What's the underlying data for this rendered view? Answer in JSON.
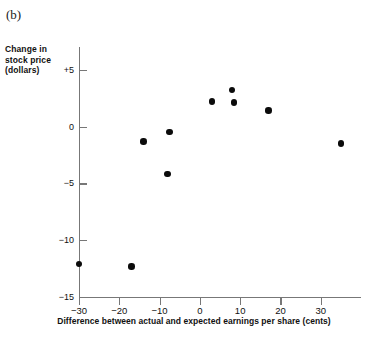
{
  "figure": {
    "panel_label": "(b)"
  },
  "chart_data": {
    "type": "scatter",
    "title": "",
    "xlabel": "Difference between actual and expected earnings per share (cents)",
    "ylabel": "Change in stock price (dollars)",
    "ylabel_lines": [
      "Change in",
      "stock price",
      "(dollars)"
    ],
    "xlim": [
      -30,
      40
    ],
    "ylim": [
      -15,
      7
    ],
    "grid": false,
    "legend": null,
    "xticks": [
      -30,
      -20,
      -10,
      0,
      10,
      20,
      30
    ],
    "xtick_labels": [
      "−30",
      "−20",
      "−10",
      "0",
      "10",
      "20",
      "30"
    ],
    "yticks": [
      5,
      0,
      -5,
      -10,
      -15
    ],
    "ytick_labels": [
      "+5",
      "0",
      "−5",
      "−10",
      "−15"
    ],
    "marker": {
      "shape": "circle",
      "color": "#0b0b0b",
      "size_px": 6.4
    },
    "points": [
      {
        "x": -30.0,
        "y": -12.1
      },
      {
        "x": -17.0,
        "y": -12.3
      },
      {
        "x": -14.0,
        "y": -1.3
      },
      {
        "x": -8.0,
        "y": -4.2
      },
      {
        "x": -7.5,
        "y": -0.5
      },
      {
        "x": 3.0,
        "y": 2.2
      },
      {
        "x": 8.0,
        "y": 3.2
      },
      {
        "x": 8.5,
        "y": 2.1
      },
      {
        "x": 17.0,
        "y": 1.4
      },
      {
        "x": 35.0,
        "y": -1.5
      }
    ]
  },
  "colors": {
    "axis": "#777777",
    "marker": "#0b0b0b",
    "text": "#111111",
    "background": "#ffffff"
  }
}
